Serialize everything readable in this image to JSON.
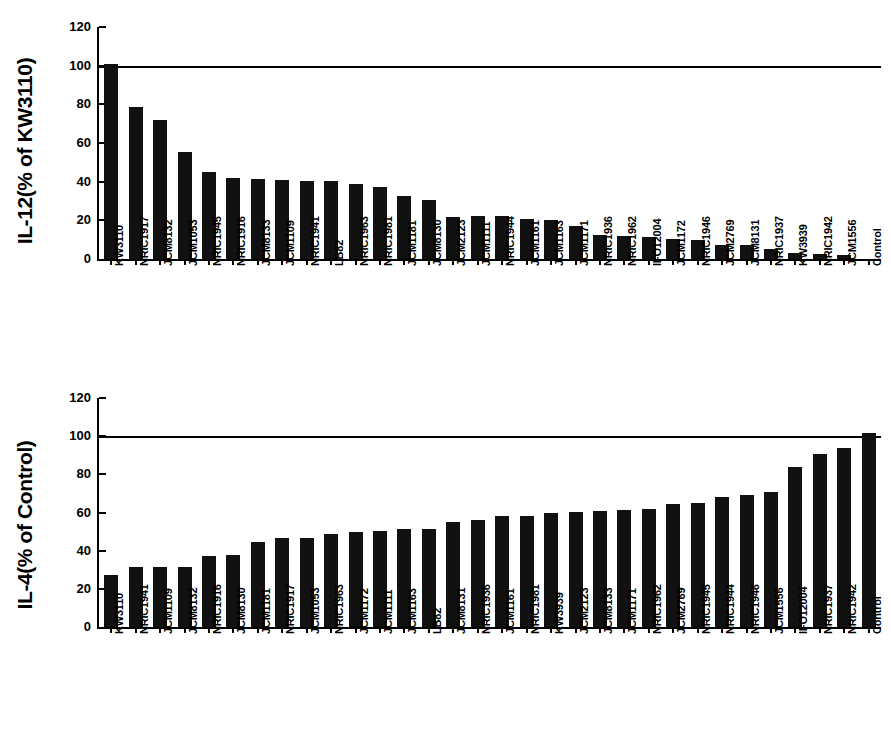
{
  "figure": {
    "background": "#ffffff",
    "bar_color": "#111111",
    "axis_color": "#000000"
  },
  "chart_data": [
    {
      "id": "il12",
      "type": "bar",
      "title": "",
      "ylabel": "IL-12(% of KW3110)",
      "xlabel": "",
      "ylim": [
        0,
        120
      ],
      "yticks": [
        0,
        20,
        40,
        60,
        80,
        100,
        120
      ],
      "grid": false,
      "legend": "none",
      "reference_line": {
        "value": 100,
        "label": ""
      },
      "categories": [
        "KW3110",
        "NRIC1917",
        "JCM8132",
        "JCM1053",
        "NRIC1945",
        "NRIC1916",
        "JCM8133",
        "JCM1109",
        "NRIC1941",
        "LB82",
        "NRIC1963",
        "NRIC1981",
        "JCM1181",
        "JCM8130",
        "JCM2123",
        "JCM1111",
        "NRIC1944",
        "JCM1161",
        "JCM1163",
        "JCM1171",
        "NRIC1936",
        "NRIC1962",
        "IFO12004",
        "JCM1172",
        "NRIC1946",
        "JCM2769",
        "JCM8131",
        "NRIC1937",
        "KW3939",
        "NRIC1942",
        "JCM1556",
        "Control"
      ],
      "values": [
        101,
        78.5,
        72,
        55.5,
        45,
        42,
        41.5,
        41,
        40.5,
        40.5,
        39,
        37,
        32.5,
        30.5,
        21.5,
        22,
        22,
        20.5,
        20,
        17,
        12.5,
        12,
        11.5,
        10.5,
        10,
        7.5,
        7.5,
        5,
        3,
        2.5,
        2,
        0
      ]
    },
    {
      "id": "il4",
      "type": "bar",
      "title": "",
      "ylabel": "IL-4(% of Control)",
      "xlabel": "",
      "ylim": [
        0,
        120
      ],
      "yticks": [
        0,
        20,
        40,
        60,
        80,
        100,
        120
      ],
      "grid": false,
      "legend": "none",
      "reference_line": {
        "value": 100,
        "label": ""
      },
      "categories": [
        "KW3110",
        "NRIC1941",
        "JCM1109",
        "JCM8132",
        "NRIC1916",
        "JCM8130",
        "JCM1181",
        "NRIC1917",
        "JCM1053",
        "NRIC1963",
        "JCM1172",
        "JCM1111",
        "JCM1163",
        "LB82",
        "JCM8131",
        "NRIC1936",
        "JCM1161",
        "NRIC1981",
        "KW3939",
        "JCM2123",
        "JCM8133",
        "JCM1171",
        "NRIC1962",
        "JCM2769",
        "NRIC1945",
        "NRIC1944",
        "NRIC1946",
        "JCM1556",
        "IFO12004",
        "NRIC1937",
        "NRIC1942",
        "Control"
      ],
      "values": [
        27.5,
        31.5,
        31.5,
        31.5,
        37,
        37.5,
        44.5,
        46.5,
        46.5,
        48.5,
        50,
        50.5,
        51.5,
        51.5,
        55,
        56,
        58,
        58,
        60,
        60.5,
        61,
        61.5,
        62,
        64.5,
        65,
        68,
        69,
        70.5,
        84,
        90.5,
        94,
        101.5
      ]
    }
  ]
}
